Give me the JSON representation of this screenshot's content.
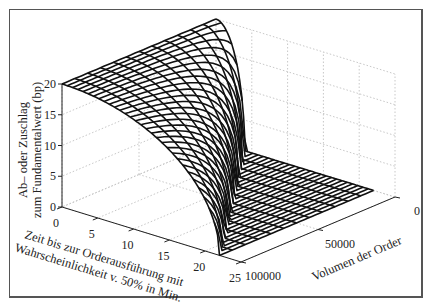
{
  "chart_data": {
    "type": "surface3d",
    "title": "",
    "zlabel_lines": [
      "Ab– oder Zuschlag",
      "zum Fundamentalwert (bp)"
    ],
    "xlabel_lines": [
      "Zeit bis zur Orderausführung mit",
      "Wahrscheinlichkeit v. 50% in Min."
    ],
    "ylabel": "Volumen der Order",
    "x_axis": {
      "name": "time_min",
      "range": [
        0,
        25
      ],
      "ticks": [
        0,
        5,
        10,
        15,
        20,
        25
      ],
      "tick_labels": [
        "0",
        "5",
        "10",
        "15",
        "20",
        "25"
      ]
    },
    "y_axis": {
      "name": "order_volume",
      "range": [
        0,
        100000
      ],
      "ticks": [
        0,
        50000,
        100000
      ],
      "tick_labels": [
        "0",
        "50000",
        "100000"
      ]
    },
    "z_axis": {
      "name": "premium_bp",
      "range": [
        0,
        20
      ],
      "ticks": [
        0,
        5,
        10,
        15,
        20
      ],
      "tick_labels": [
        "0",
        "5",
        "10",
        "15",
        "20"
      ]
    },
    "grid": true,
    "surface": {
      "description": "Mesh surface: premium is 20 bp at time 0 for all volumes and declines toward 0 as time increases; decline occurs at larger times for larger volumes.",
      "t_max": 22,
      "z_at_t0": 20,
      "t_lines": 30,
      "v_lines": 12
    }
  }
}
